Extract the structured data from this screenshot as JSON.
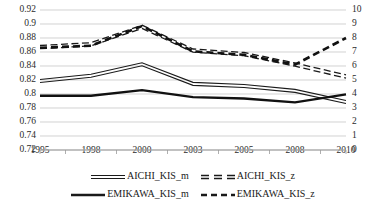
{
  "chart_data": {
    "type": "line",
    "title": "",
    "xlabel": "",
    "ylabel": "",
    "categories": [
      "1995",
      "1998",
      "2000",
      "2003",
      "2005",
      "2008",
      "2010"
    ],
    "grid": true,
    "legend_position": "bottom",
    "axes": {
      "left": {
        "label": "",
        "ylim": [
          0.72,
          0.92
        ],
        "ticks": [
          "0.72",
          "0.74",
          "0.76",
          "0.78",
          "0.8",
          "0.82",
          "0.84",
          "0.86",
          "0.88",
          "0.9",
          "0.92"
        ],
        "tick_values": [
          0.72,
          0.74,
          0.76,
          0.78,
          0.8,
          0.82,
          0.84,
          0.86,
          0.88,
          0.9,
          0.92
        ]
      },
      "right": {
        "label": "",
        "ylim": [
          0,
          10
        ],
        "ticks": [
          "0",
          "1",
          "2",
          "3",
          "4",
          "5",
          "6",
          "7",
          "8",
          "9",
          "10"
        ],
        "tick_values": [
          0,
          1,
          2,
          3,
          4,
          5,
          6,
          7,
          8,
          9,
          10
        ]
      }
    },
    "series": [
      {
        "name": "AICHI_KIS_m",
        "axis": "left",
        "style": "double-thin-solid",
        "color": "#1a1a1a",
        "values": [
          0.8185,
          0.826,
          0.8425,
          0.8145,
          0.8115,
          0.8045,
          0.7885
        ]
      },
      {
        "name": "AICHI_KIS_z",
        "axis": "right",
        "style": "double-dashed",
        "color": "#1a1a1a",
        "values": [
          7.35,
          7.55,
          8.8,
          7.1,
          6.85,
          6.1,
          5.25
        ]
      },
      {
        "name": "EMIKAWA_KIS_m",
        "axis": "left",
        "style": "thick-solid",
        "color": "#111111",
        "values": [
          0.7975,
          0.7975,
          0.8055,
          0.7955,
          0.7935,
          0.788,
          0.7995
        ]
      },
      {
        "name": "EMIKAWA_KIS_z",
        "axis": "right",
        "style": "thick-dashed",
        "color": "#111111",
        "values": [
          7.3,
          7.45,
          8.85,
          7.05,
          6.8,
          6.1,
          8.0
        ]
      }
    ]
  },
  "legend": {
    "entries": [
      {
        "label": "AICHI_KIS_m",
        "style": "double-thin-solid"
      },
      {
        "label": "AICHI_KIS_z",
        "style": "double-dashed"
      },
      {
        "label": "EMIKAWA_KIS_m",
        "style": "thick-solid"
      },
      {
        "label": "EMIKAWA_KIS_z",
        "style": "thick-dashed"
      }
    ]
  },
  "colors": {
    "axis": "#9a9a9a",
    "grid": "#bfbfbf",
    "text": "#2b2b2b",
    "line": "#1a1a1a",
    "background": "#ffffff"
  }
}
